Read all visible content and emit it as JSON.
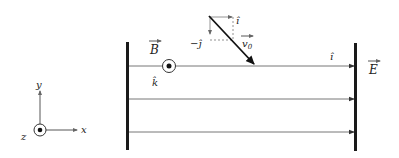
{
  "diagram": {
    "labels": {
      "B": "B",
      "k_hat": "k̂",
      "E": "E",
      "i_hat_field": "î",
      "i_hat_top": "î",
      "minus_j_hat": "−ĵ",
      "v0": "v",
      "v0_sub": "0"
    },
    "axes": {
      "x": "x",
      "y": "y",
      "z": "z"
    },
    "field_lines": [
      {
        "y": 66
      },
      {
        "y": 99
      },
      {
        "y": 132
      }
    ],
    "colors": {
      "plate": "#1a1a1a",
      "line": "#555555",
      "text": "#222222"
    }
  }
}
